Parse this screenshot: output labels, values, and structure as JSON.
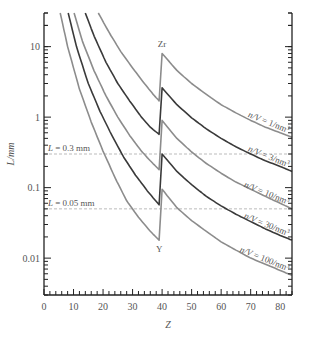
{
  "chart_data": {
    "type": "line",
    "title": "",
    "xlabel": "Z",
    "ylabel": "L/mm",
    "xlim": [
      0,
      84
    ],
    "ylim": [
      0.003,
      30
    ],
    "yscale": "log",
    "grid": false,
    "x_ticks": [
      0,
      10,
      20,
      30,
      40,
      50,
      60,
      70,
      80
    ],
    "x_tick_labels": [
      "0",
      "10",
      "20",
      "30",
      "40",
      "50",
      "60",
      "70",
      "80"
    ],
    "y_ticks": [
      0.01,
      0.1,
      1,
      10
    ],
    "y_tick_labels": [
      "0.01",
      "0.1",
      "1",
      "10"
    ],
    "reference_lines": [
      {
        "value": 0.3,
        "label": "L = 0.3 mm"
      },
      {
        "value": 0.05,
        "label": "L = 0.05 mm"
      }
    ],
    "annotations": [
      {
        "text": "Zr",
        "x": 40,
        "y": 8
      },
      {
        "text": "Y",
        "x": 39,
        "y": 0.018
      }
    ],
    "series": [
      {
        "name": "n/V = 1/nm³",
        "color": "#8c8c8c",
        "left": [
          [
            18.4,
            30
          ],
          [
            22,
            16
          ],
          [
            26,
            8.5
          ],
          [
            30,
            5.0
          ],
          [
            34,
            3.0
          ],
          [
            37,
            2.1
          ],
          [
            39,
            1.7
          ]
        ],
        "right": [
          [
            40,
            8.0
          ],
          [
            45,
            4.6
          ],
          [
            50,
            3.0
          ],
          [
            55,
            2.1
          ],
          [
            60,
            1.5
          ],
          [
            65,
            1.15
          ],
          [
            70,
            0.9
          ],
          [
            75,
            0.72
          ],
          [
            80,
            0.6
          ],
          [
            84,
            0.52
          ]
        ]
      },
      {
        "name": "n/V = 3/nm³",
        "color": "#3a3a3a",
        "left": [
          [
            14,
            30
          ],
          [
            17,
            14
          ],
          [
            21,
            6.0
          ],
          [
            25,
            3.0
          ],
          [
            29,
            1.7
          ],
          [
            33,
            1.0
          ],
          [
            36,
            0.72
          ],
          [
            39,
            0.57
          ]
        ],
        "right": [
          [
            40,
            2.6
          ],
          [
            45,
            1.5
          ],
          [
            50,
            0.98
          ],
          [
            55,
            0.68
          ],
          [
            60,
            0.5
          ],
          [
            65,
            0.38
          ],
          [
            70,
            0.3
          ],
          [
            75,
            0.24
          ],
          [
            80,
            0.2
          ],
          [
            84,
            0.17
          ]
        ]
      },
      {
        "name": "n/V = 10/nm³",
        "color": "#8c8c8c",
        "left": [
          [
            10.2,
            30
          ],
          [
            13,
            12
          ],
          [
            17,
            4.5
          ],
          [
            21,
            2.0
          ],
          [
            25,
            1.0
          ],
          [
            29,
            0.55
          ],
          [
            33,
            0.33
          ],
          [
            36,
            0.24
          ],
          [
            39,
            0.18
          ]
        ],
        "right": [
          [
            40,
            0.9
          ],
          [
            45,
            0.5
          ],
          [
            50,
            0.32
          ],
          [
            55,
            0.22
          ],
          [
            60,
            0.16
          ],
          [
            65,
            0.12
          ],
          [
            70,
            0.095
          ],
          [
            75,
            0.075
          ],
          [
            80,
            0.06
          ],
          [
            84,
            0.05
          ]
        ]
      },
      {
        "name": "n/V = 30/nm³",
        "color": "#3a3a3a",
        "left": [
          [
            8.2,
            30
          ],
          [
            11,
            10
          ],
          [
            15,
            3.0
          ],
          [
            19,
            1.2
          ],
          [
            23,
            0.55
          ],
          [
            27,
            0.27
          ],
          [
            31,
            0.15
          ],
          [
            35,
            0.09
          ],
          [
            39,
            0.057
          ]
        ],
        "right": [
          [
            40,
            0.3
          ],
          [
            45,
            0.17
          ],
          [
            50,
            0.11
          ],
          [
            55,
            0.075
          ],
          [
            60,
            0.055
          ],
          [
            65,
            0.042
          ],
          [
            70,
            0.033
          ],
          [
            75,
            0.026
          ],
          [
            80,
            0.021
          ],
          [
            84,
            0.018
          ]
        ]
      },
      {
        "name": "n/V = 100/nm³",
        "color": "#8c8c8c",
        "left": [
          [
            5.5,
            30
          ],
          [
            8,
            10
          ],
          [
            12,
            2.5
          ],
          [
            16,
            0.85
          ],
          [
            20,
            0.33
          ],
          [
            24,
            0.14
          ],
          [
            28,
            0.065
          ],
          [
            32,
            0.038
          ],
          [
            36,
            0.024
          ],
          [
            39,
            0.018
          ]
        ],
        "right": [
          [
            40,
            0.095
          ],
          [
            45,
            0.052
          ],
          [
            50,
            0.034
          ],
          [
            55,
            0.024
          ],
          [
            60,
            0.017
          ],
          [
            65,
            0.013
          ],
          [
            70,
            0.01
          ],
          [
            75,
            0.0082
          ],
          [
            80,
            0.0067
          ],
          [
            84,
            0.0057
          ]
        ]
      }
    ]
  }
}
